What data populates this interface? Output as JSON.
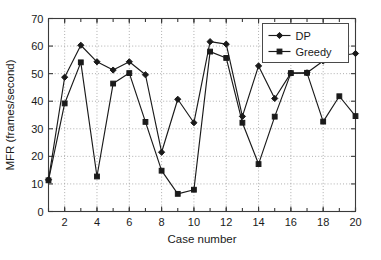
{
  "chart_data": {
    "type": "line",
    "title": "",
    "xlabel": "Case number",
    "ylabel": "MFR (frames/second)",
    "xlim": [
      1,
      20
    ],
    "ylim": [
      0,
      70
    ],
    "grid": true,
    "legend_position": "top-right",
    "x": [
      1,
      2,
      3,
      4,
      5,
      6,
      7,
      8,
      9,
      10,
      11,
      12,
      13,
      14,
      15,
      16,
      17,
      18,
      19,
      20
    ],
    "xticks": [
      2,
      4,
      6,
      8,
      10,
      12,
      14,
      16,
      18,
      20
    ],
    "xticklabels": [
      "2",
      "4",
      "6",
      "8",
      "10",
      "12",
      "14",
      "16",
      "18",
      "20"
    ],
    "yticks": [
      0,
      10,
      20,
      30,
      40,
      50,
      60,
      70
    ],
    "yticklabels": [
      "0",
      "10",
      "20",
      "30",
      "40",
      "50",
      "60",
      "70"
    ],
    "series": [
      {
        "name": "DP",
        "marker": "diamond",
        "color": "#1a1a1a",
        "values": [
          11.5,
          48.7,
          60.3,
          54.3,
          51.3,
          54.3,
          49.6,
          21.5,
          40.7,
          32.2,
          61.6,
          60.7,
          34.5,
          52.8,
          41.0,
          50.2,
          50.3,
          54.6,
          56.5,
          57.3
        ]
      },
      {
        "name": "Greedy",
        "marker": "square",
        "color": "#1a1a1a",
        "values": [
          11.3,
          39.2,
          54.1,
          12.7,
          46.4,
          50.2,
          32.5,
          14.8,
          6.4,
          7.9,
          58.0,
          55.7,
          32.2,
          17.2,
          34.4,
          50.2,
          50.3,
          32.6,
          41.8,
          34.6
        ]
      }
    ]
  },
  "legend": {
    "entries": [
      "DP",
      "Greedy"
    ]
  }
}
